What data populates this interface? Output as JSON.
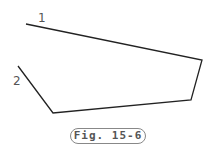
{
  "diagram": {
    "polyline": [
      [
        26,
        24
      ],
      [
        202,
        60
      ],
      [
        191,
        100
      ],
      [
        53,
        113
      ],
      [
        18,
        66
      ]
    ],
    "stroke_color": "#222222",
    "labels": [
      {
        "id": "1",
        "text": "1",
        "x": 38,
        "y": 12
      },
      {
        "id": "2",
        "text": "2",
        "x": 13,
        "y": 75
      }
    ],
    "caption": "Fig. 15-6"
  }
}
